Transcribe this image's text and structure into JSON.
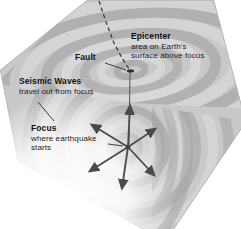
{
  "figure": {
    "labels": {
      "epicenter": {
        "term": "Epicenter",
        "desc1": "area on Earth's",
        "desc2": "surface above focus"
      },
      "fault": {
        "term": "Fault"
      },
      "seismic_waves": {
        "term": "Seismic Waves",
        "desc1": "travel out from focus"
      },
      "focus": {
        "term": "Focus",
        "desc1": "where earthquake",
        "desc2": "starts"
      }
    },
    "colors": {
      "background": "#ffffff",
      "text": "#1a1a1a",
      "arrow": "#4a4a4a",
      "rock_base": "#c9c9c9",
      "band_dark": "#ababab",
      "band_light": "#d8d8d8",
      "fault_line": "#3d3d3d"
    }
  }
}
